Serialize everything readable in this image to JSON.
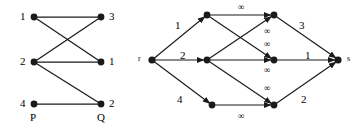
{
  "figure": {
    "background": "#ffffff",
    "ink": "#1a1a1a",
    "node_radius": 3.4
  },
  "left_graph": {
    "name": "bipartite-graph-PQ",
    "side_labels": {
      "left": "P",
      "right": "Q"
    },
    "left_nodes": [
      {
        "id": "p1",
        "label": "1",
        "x": 34,
        "y": 17
      },
      {
        "id": "p2",
        "label": "2",
        "x": 34,
        "y": 62
      },
      {
        "id": "p3",
        "label": "4",
        "x": 34,
        "y": 104
      }
    ],
    "right_nodes": [
      {
        "id": "q1",
        "label": "3",
        "x": 101,
        "y": 17
      },
      {
        "id": "q2",
        "label": "1",
        "x": 101,
        "y": 62
      },
      {
        "id": "q3",
        "label": "2",
        "x": 101,
        "y": 104
      }
    ],
    "edges": [
      {
        "from": "p1",
        "to": "q1"
      },
      {
        "from": "p1",
        "to": "q2"
      },
      {
        "from": "p2",
        "to": "q1"
      },
      {
        "from": "p2",
        "to": "q2"
      },
      {
        "from": "p2",
        "to": "q3"
      }
    ]
  },
  "right_graph": {
    "name": "flow-network-rs",
    "source": {
      "id": "r",
      "label": "r",
      "x": 152,
      "y": 60
    },
    "sink": {
      "id": "s",
      "label": "s",
      "x": 338,
      "y": 60
    },
    "left_nodes": [
      {
        "id": "u1",
        "x": 207,
        "y": 15
      },
      {
        "id": "u2",
        "x": 207,
        "y": 60
      },
      {
        "id": "u3",
        "x": 212,
        "y": 105
      }
    ],
    "right_nodes": [
      {
        "id": "v1",
        "x": 274,
        "y": 15
      },
      {
        "id": "v2",
        "x": 274,
        "y": 60
      },
      {
        "id": "v3",
        "x": 274,
        "y": 105
      }
    ],
    "source_edges": [
      {
        "from": "r",
        "to": "u1",
        "capacity": "1",
        "label_x": 175,
        "label_y": 20
      },
      {
        "from": "r",
        "to": "u2",
        "capacity": "2",
        "label_x": 180,
        "label_y": 50
      },
      {
        "from": "r",
        "to": "u3",
        "capacity": "4",
        "label_x": 177,
        "label_y": 94
      }
    ],
    "middle_edges": [
      {
        "from": "u1",
        "to": "v1",
        "capacity": "∞",
        "label_x": 238,
        "label_y": 4
      },
      {
        "from": "u1",
        "to": "v2",
        "capacity": "∞",
        "label_x": 264,
        "label_y": 40
      },
      {
        "from": "u2",
        "to": "v1",
        "capacity": "∞",
        "label_x": 264,
        "label_y": 28
      },
      {
        "from": "u2",
        "to": "v2",
        "capacity": "∞",
        "label_x": 264,
        "label_y": 66
      },
      {
        "from": "u2",
        "to": "v3",
        "capacity": "∞",
        "label_x": 264,
        "label_y": 85
      },
      {
        "from": "u3",
        "to": "v3",
        "capacity": "∞",
        "label_x": 238,
        "label_y": 113
      }
    ],
    "sink_edges": [
      {
        "from": "v1",
        "to": "s",
        "capacity": "3",
        "label_x": 299,
        "label_y": 20
      },
      {
        "from": "v2",
        "to": "s",
        "capacity": "1",
        "label_x": 305,
        "label_y": 50
      },
      {
        "from": "v3",
        "to": "s",
        "capacity": "2",
        "label_x": 301,
        "label_y": 94
      }
    ]
  }
}
